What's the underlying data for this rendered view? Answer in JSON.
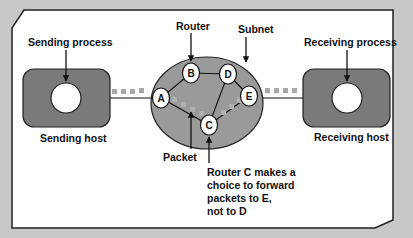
{
  "diagram": {
    "colors": {
      "background": "#c8c8c8",
      "frame_fill": "#ffffff",
      "frame_stroke": "#222222",
      "host_fill": "#7a7a7a",
      "subnet_fill": "#9a9a9a",
      "packet_dots": "#a8a8a8",
      "node_fill": "#ffffff",
      "line": "#111111"
    },
    "labels": {
      "sending_process": "Sending process",
      "sending_host": "Sending host",
      "router": "Router",
      "subnet": "Subnet",
      "receiving_process": "Receiving process",
      "receiving_host": "Receiving host",
      "packet": "Packet",
      "note_line1": "Router C makes a",
      "note_line2": "choice to forward",
      "note_line3": "packets to E,",
      "note_line4": "not to D"
    },
    "routers": [
      {
        "id": "A",
        "label": "A"
      },
      {
        "id": "B",
        "label": "B"
      },
      {
        "id": "C",
        "label": "C"
      },
      {
        "id": "D",
        "label": "D"
      },
      {
        "id": "E",
        "label": "E"
      }
    ],
    "links": [
      [
        "A",
        "B"
      ],
      [
        "B",
        "D"
      ],
      [
        "A",
        "C"
      ],
      [
        "C",
        "D"
      ],
      [
        "C",
        "E"
      ],
      [
        "D",
        "E"
      ]
    ],
    "packet_path": [
      "Sending host",
      "A",
      "C",
      "E",
      "Receiving host"
    ]
  }
}
